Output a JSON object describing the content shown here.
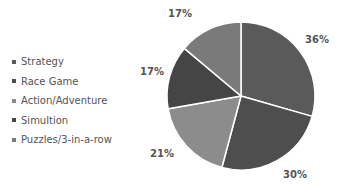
{
  "chart_data": {
    "type": "pie",
    "title": "",
    "categories": [
      "Strategy",
      "Race Game",
      "Action/Adventure",
      "Simultion",
      "Puzzles/3-in-a-row"
    ],
    "values": [
      36,
      30,
      21,
      17,
      17
    ],
    "labels": [
      "36%",
      "30%",
      "21%",
      "17%",
      "17%"
    ],
    "slice_angles_deg": [
      106,
      89,
      65,
      50,
      50
    ],
    "colors": [
      "#5a5a5a",
      "#4e4e4e",
      "#8c8c8c",
      "#454545",
      "#7a7a7a"
    ],
    "legend_position": "left",
    "start_angle": "12 o'clock, clockwise"
  },
  "legend": {
    "items": [
      {
        "label": "Strategy"
      },
      {
        "label": "Race Game"
      },
      {
        "label": "Action/Adventure"
      },
      {
        "label": "Simultion"
      },
      {
        "label": "Puzzles/3-in-a-row"
      }
    ]
  }
}
